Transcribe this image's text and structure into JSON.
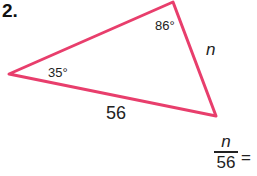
{
  "problem": {
    "number": "2.",
    "triangle": {
      "stroke_color": "#e83e6c",
      "vertices": {
        "left": [
          9,
          74
        ],
        "top": [
          173,
          2
        ],
        "right": [
          216,
          116
        ]
      },
      "angle_top": "86°",
      "angle_left": "35°",
      "side_bottom": "56",
      "side_right": "n"
    },
    "equation": {
      "numerator": "n",
      "denominator": "56",
      "equals": "="
    }
  }
}
